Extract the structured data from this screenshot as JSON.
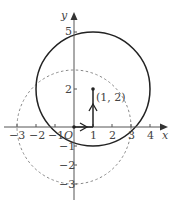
{
  "diagram": {
    "axes": {
      "x_label": "x",
      "y_label": "y",
      "origin_label": "O"
    },
    "x_ticks": [
      {
        "v": -3,
        "label": "−3"
      },
      {
        "v": -2,
        "label": "−2"
      },
      {
        "v": -1,
        "label": "−1"
      },
      {
        "v": 1,
        "label": "1"
      },
      {
        "v": 2,
        "label": "2"
      },
      {
        "v": 3,
        "label": "3"
      },
      {
        "v": 4,
        "label": "4"
      }
    ],
    "y_ticks": [
      {
        "v": 5,
        "label": "5"
      },
      {
        "v": 2,
        "label": "2"
      },
      {
        "v": -1,
        "label": "−1"
      },
      {
        "v": -2,
        "label": "−2"
      },
      {
        "v": -3,
        "label": "−3"
      }
    ],
    "point_label": "(1, 2)",
    "solid_circle": {
      "center": [
        1,
        2
      ],
      "radius": 3
    },
    "dashed_circle": {
      "center": [
        0,
        0
      ],
      "radius": 3
    },
    "translation": {
      "from": [
        0,
        0
      ],
      "via": [
        1,
        0
      ],
      "to": [
        1,
        2
      ]
    },
    "colors": {
      "ink": "#222222",
      "dashed": "#888888",
      "text": "#444444"
    }
  }
}
